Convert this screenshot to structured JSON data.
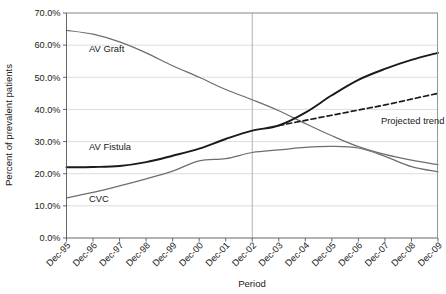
{
  "chart_data": {
    "type": "line",
    "title": "",
    "xlabel": "Period",
    "ylabel": "Percent of prevalent patients",
    "categories": [
      "Dec-95",
      "Dec-96",
      "Dec-97",
      "Dec-98",
      "Dec-99",
      "Dec-00",
      "Dec-01",
      "Dec-02",
      "Dec-03",
      "Dec-04",
      "Dec-05",
      "Dec-06",
      "Dec-07",
      "Dec-08",
      "Dec-09"
    ],
    "ylim": [
      0,
      70
    ],
    "ytick_labels": [
      "0.0%",
      "10.0%",
      "20.0%",
      "30.0%",
      "40.0%",
      "50.0%",
      "60.0%",
      "70.0%"
    ],
    "ytick_values": [
      0,
      10,
      20,
      30,
      40,
      50,
      60,
      70
    ],
    "grid": "horizontal",
    "legend": "inline-labels",
    "series": [
      {
        "name": "AV Graft",
        "color": "#6e6e6e",
        "style": "solid",
        "label_x": "Dec-96",
        "label_y": 58.0,
        "values": [
          64.6,
          63.4,
          61.0,
          57.6,
          53.6,
          50.0,
          46.2,
          43.0,
          39.6,
          35.6,
          31.8,
          28.4,
          26.0,
          24.2,
          22.8
        ]
      },
      {
        "name": "AV Fistula",
        "color": "#1a1a1a",
        "style": "solid",
        "label_x": "Dec-96",
        "label_y": 27.4,
        "values": [
          22.0,
          22.1,
          22.4,
          23.6,
          25.6,
          27.8,
          30.8,
          33.4,
          35.0,
          39.0,
          44.4,
          49.2,
          52.6,
          55.4,
          57.6
        ]
      },
      {
        "name": "CVC",
        "color": "#6e6e6e",
        "style": "solid",
        "label_x": "Dec-96",
        "label_y": 11.2,
        "values": [
          12.5,
          14.2,
          16.2,
          18.4,
          20.8,
          24.0,
          24.7,
          26.6,
          27.4,
          28.2,
          28.5,
          28.0,
          25.4,
          22.2,
          20.6
        ]
      },
      {
        "name": "Projected trend",
        "color": "#1a1a1a",
        "style": "dashed",
        "label_x": "Dec-07",
        "label_y": 35.6,
        "start_category": "Dec-03",
        "values": [
          null,
          null,
          null,
          null,
          null,
          null,
          null,
          null,
          35.0,
          36.6,
          38.2,
          39.8,
          41.4,
          43.2,
          45.0
        ]
      }
    ],
    "annotations": [
      {
        "name": "reference-line",
        "at_category": "Dec-02",
        "orientation": "vertical"
      }
    ]
  }
}
